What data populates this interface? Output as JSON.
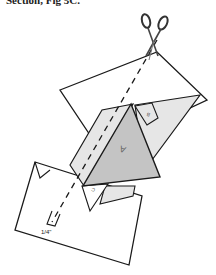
{
  "caption": "Section, Fig 5C.",
  "diagram": {
    "labels": {
      "measurement": "1/4\"",
      "letter_a": "A",
      "letter_b": "B",
      "letter_c": "C"
    },
    "colors": {
      "outline": "#1a1a1a",
      "paper_white": "#ffffff",
      "paper_light": "#e6e6e6",
      "paper_mid": "#c4c4c4"
    }
  }
}
